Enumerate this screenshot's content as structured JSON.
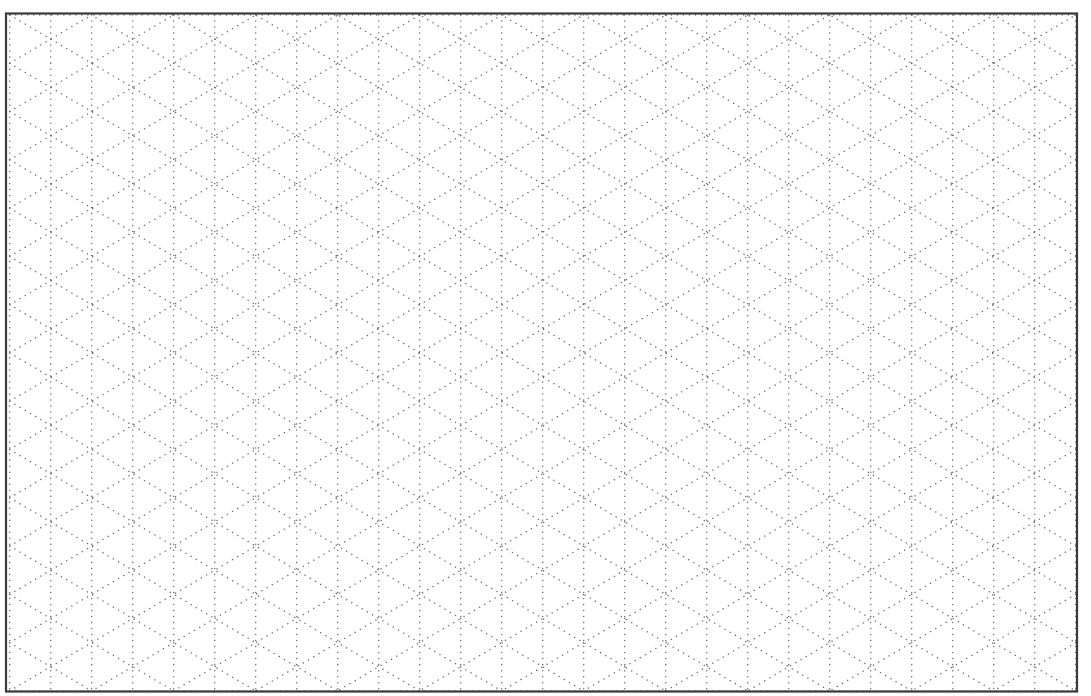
{
  "page": {
    "background": "#ffffff"
  },
  "grid": {
    "type": "isometric-dotted",
    "border": {
      "x": 6,
      "y": 13.5,
      "width": 1071,
      "height": 678,
      "color": "#3a3a3a",
      "stroke_width": 2.2
    },
    "origin_x": 9.7,
    "origin_y": 15,
    "column_spacing": 41,
    "columns": 26,
    "half_period": 24.14,
    "periods": 14,
    "dot_color": "#6e6e6e",
    "dot_size": 1.5,
    "dot_gap": 6
  }
}
